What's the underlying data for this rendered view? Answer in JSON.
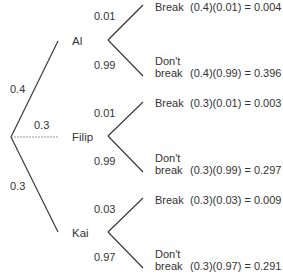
{
  "colors": {
    "line": "#3a3a3a",
    "dashed_line": "#9a9a9a",
    "text": "#333333"
  },
  "first_level": [
    {
      "name": "Al",
      "prob": "0.4"
    },
    {
      "name": "Filip",
      "prob": "0.3"
    },
    {
      "name": "Kai",
      "prob": "0.3"
    }
  ],
  "second_level": [
    {
      "parent": "Al",
      "break_prob": "0.01",
      "dont_break_prob": "0.99",
      "break_label": "Break",
      "dont_break_label_1": "Don't",
      "dont_break_label_2": "break",
      "break_result": "(0.4)(0.01) = 0.004",
      "dont_break_result": "(0.4)(0.99) = 0.396"
    },
    {
      "parent": "Filip",
      "break_prob": "0.01",
      "dont_break_prob": "0.99",
      "break_label": "Break",
      "dont_break_label_1": "Don't",
      "dont_break_label_2": "break",
      "break_result": "(0.3)(0.01) = 0.003",
      "dont_break_result": "(0.3)(0.99) = 0.297"
    },
    {
      "parent": "Kai",
      "break_prob": "0.03",
      "dont_break_prob": "0.97",
      "break_label": "Break",
      "dont_break_label_1": "Don't",
      "dont_break_label_2": "break",
      "break_result": "(0.3)(0.03) = 0.009",
      "dont_break_result": "(0.3)(0.97) = 0.291"
    }
  ]
}
